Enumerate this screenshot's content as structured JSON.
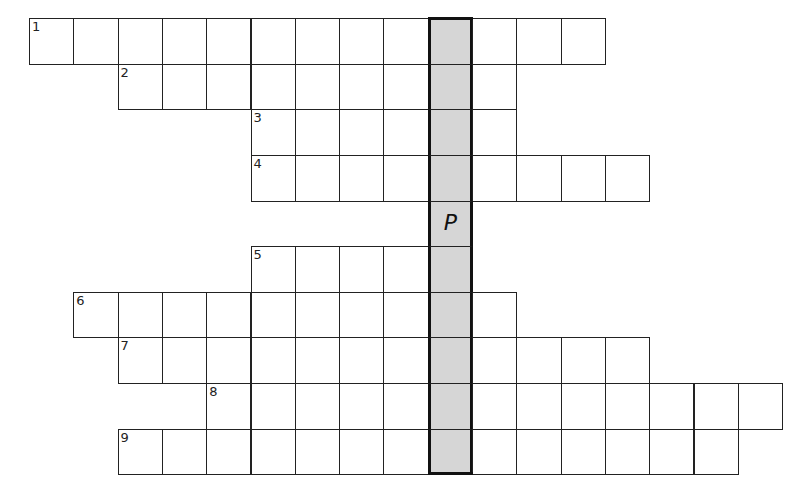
{
  "puzzle": {
    "type": "crossword",
    "cell_size": 44.3,
    "origin_x": 29,
    "origin_y": 18,
    "shaded_column": 9,
    "shaded_color": "#d6d6d6",
    "rows": [
      {
        "row": 0,
        "clue_number": "1",
        "start_col": 0,
        "end_col": 12,
        "letters": {}
      },
      {
        "row": 1,
        "clue_number": "2",
        "start_col": 2,
        "end_col": 10,
        "letters": {}
      },
      {
        "row": 2,
        "clue_number": "3",
        "start_col": 5,
        "end_col": 10,
        "letters": {}
      },
      {
        "row": 3,
        "clue_number": "4",
        "start_col": 5,
        "end_col": 13,
        "letters": {}
      },
      {
        "row": 4,
        "clue_number": "",
        "start_col": 9,
        "end_col": 9,
        "letters": {
          "9": "P"
        }
      },
      {
        "row": 5,
        "clue_number": "5",
        "start_col": 5,
        "end_col": 9,
        "letters": {}
      },
      {
        "row": 6,
        "clue_number": "6",
        "start_col": 1,
        "end_col": 10,
        "letters": {}
      },
      {
        "row": 7,
        "clue_number": "7",
        "start_col": 2,
        "end_col": 13,
        "letters": {}
      },
      {
        "row": 8,
        "clue_number": "8",
        "start_col": 4,
        "end_col": 16,
        "letters": {}
      },
      {
        "row": 9,
        "clue_number": "9",
        "start_col": 2,
        "end_col": 15,
        "letters": {}
      }
    ]
  }
}
